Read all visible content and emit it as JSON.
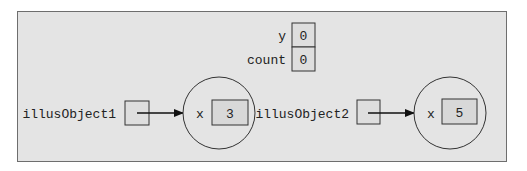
{
  "static_vars": [
    {
      "name": "y",
      "value": "0"
    },
    {
      "name": "count",
      "value": "0"
    }
  ],
  "objects": [
    {
      "ref_name": "illusObject1",
      "field": "x",
      "value": "3"
    },
    {
      "ref_name": "illusObject2",
      "field": "x",
      "value": "5"
    }
  ],
  "colors": {
    "panel_fill": "#e4e4e4",
    "panel_border": "#6e6e6e",
    "stroke": "#333333",
    "cell_fill": "#dcdcdc"
  }
}
